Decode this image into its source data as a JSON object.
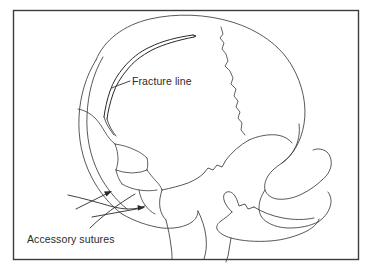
{
  "figure": {
    "background_color": "#ffffff",
    "frame_color": "#3c3c3c",
    "line_color": "#3a3a3a",
    "text_color": "#2b2b2b"
  },
  "labels": {
    "fracture_line": "Fracture line",
    "accessory_sutures": "Accessory sutures"
  },
  "annotations": {
    "fracture_leader_name": "fracture-line-leader",
    "accessory_leader_name": "accessory-sutures-leader"
  }
}
